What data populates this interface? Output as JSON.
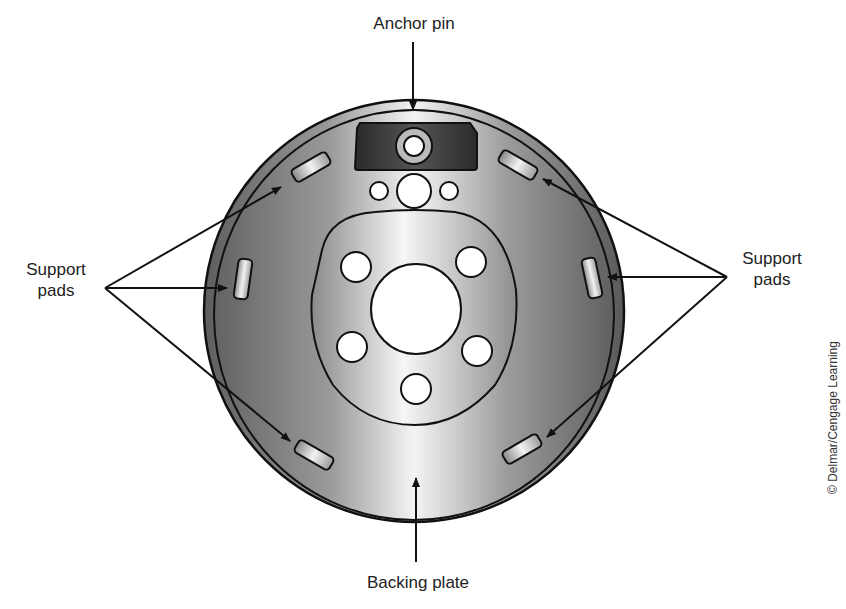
{
  "diagram": {
    "labels": {
      "anchor_pin": "Anchor pin",
      "support_pads_left_line1": "Support",
      "support_pads_left_line2": "pads",
      "support_pads_right_line1": "Support",
      "support_pads_right_line2": "pads",
      "backing_plate": "Backing plate"
    },
    "credit": "© Delmar/Cengage Learning",
    "components": [
      "anchor pin",
      "support pads (6)",
      "backing plate",
      "axle hole",
      "mounting bolt holes (5)"
    ],
    "colors": {
      "plate_dark": "#5a5a5a",
      "plate_light": "#f2f2f2",
      "anchor_block": "#333333",
      "outline": "#111111"
    }
  }
}
